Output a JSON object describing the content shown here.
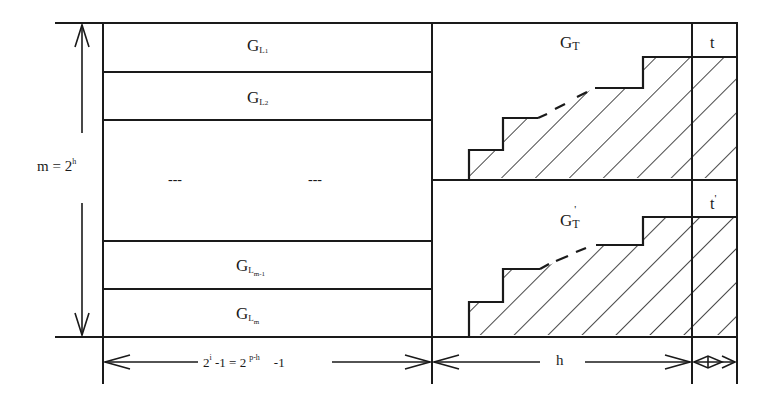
{
  "diagram": {
    "left_blocks": [
      {
        "base": "G",
        "sub1": "L",
        "sub2": "1"
      },
      {
        "base": "G",
        "sub1": "L",
        "sub2": "2"
      },
      {
        "ellipsis_left": "---",
        "ellipsis_right": "---"
      },
      {
        "base": "G",
        "sub1": "L",
        "sub2": "m-1"
      },
      {
        "base": "G",
        "sub1": "L",
        "sub2": "m"
      }
    ],
    "right_top": {
      "base": "G",
      "sub": "T",
      "prime": ""
    },
    "right_bottom": {
      "base": "G",
      "sub": "T",
      "prime": "'"
    },
    "col_t_top": {
      "label": "t",
      "prime": ""
    },
    "col_t_bottom": {
      "label": "t",
      "prime": "'"
    },
    "vertical_dim": {
      "lhs": "m = 2",
      "sup": "h"
    },
    "bottom_dim_left": {
      "a": "2",
      "a_sup": "i",
      "b": " -1 = 2",
      "b_sup": "p-h",
      "c": "-1"
    },
    "bottom_dim_mid": {
      "label": "h"
    },
    "colors": {
      "line": "#1a1a1a",
      "background": "#ffffff"
    }
  }
}
